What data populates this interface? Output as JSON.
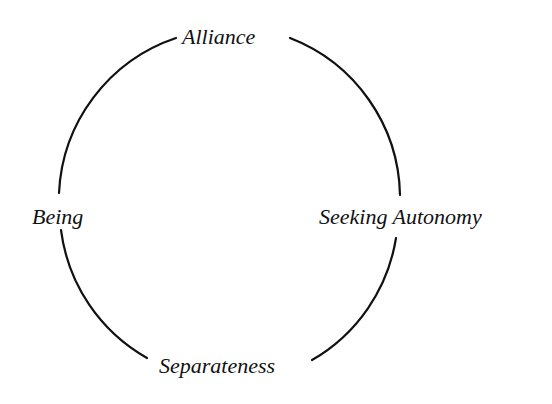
{
  "diagram": {
    "type": "cycle",
    "nodes": [
      {
        "id": "top",
        "label": "Alliance"
      },
      {
        "id": "right",
        "label": "Seeking Autonomy"
      },
      {
        "id": "bottom",
        "label": "Separateness"
      },
      {
        "id": "left",
        "label": "Being"
      }
    ],
    "edges": [
      {
        "from": "Alliance",
        "to": "Seeking Autonomy"
      },
      {
        "from": "Seeking Autonomy",
        "to": "Separateness"
      },
      {
        "from": "Separateness",
        "to": "Being"
      },
      {
        "from": "Being",
        "to": "Alliance"
      }
    ],
    "colors": {
      "stroke": "#111111",
      "text": "#111111",
      "background": "#ffffff"
    }
  }
}
